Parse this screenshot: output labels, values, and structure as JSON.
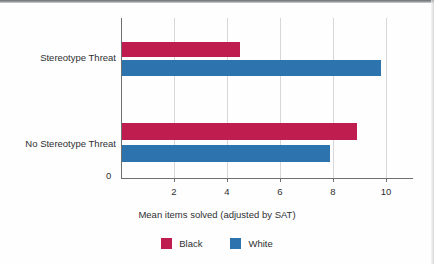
{
  "chart_data": {
    "type": "bar",
    "orientation": "horizontal",
    "title": "",
    "xlabel": "Mean items solved (adjusted by SAT)",
    "ylabel": "",
    "categories": [
      "Stereotype Threat",
      "No Stereotype Threat"
    ],
    "series": [
      {
        "name": "Black",
        "color": "#bf1d4f",
        "values": [
          4.5,
          8.9
        ]
      },
      {
        "name": "White",
        "color": "#2d73ae",
        "values": [
          9.8,
          7.9
        ]
      }
    ],
    "xlim": [
      0,
      11
    ],
    "xticks": [
      0,
      2,
      4,
      6,
      8,
      10
    ],
    "xtick_labels": [
      "0",
      "2",
      "4",
      "6",
      "8",
      "10"
    ],
    "grid": "vertical",
    "legend_position": "bottom-center"
  },
  "axis": {
    "zero_label": "0",
    "tick_labels": [
      "2",
      "4",
      "6",
      "8",
      "10"
    ],
    "title": "Mean items solved (adjusted by SAT)"
  },
  "categories": {
    "top": "Stereotype Threat",
    "bottom": "No Stereotype Threat"
  },
  "legend": {
    "items": [
      {
        "label": "Black",
        "color": "#bf1d4f"
      },
      {
        "label": "White",
        "color": "#2d73ae"
      }
    ]
  },
  "bars": {
    "st_black": {
      "value": 4.5,
      "label": "Stereotype Threat Black"
    },
    "st_white": {
      "value": 9.8,
      "label": "Stereotype Threat White"
    },
    "nst_black": {
      "value": 8.9,
      "label": "No Stereotype Threat Black"
    },
    "nst_white": {
      "value": 7.9,
      "label": "No Stereotype Threat White"
    }
  }
}
